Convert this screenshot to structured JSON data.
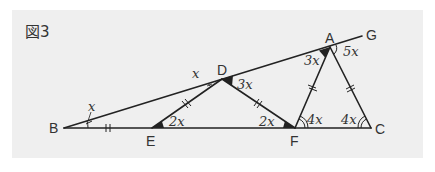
{
  "figure": {
    "label": "図3",
    "background_color": "#efefef",
    "line_color": "#222222"
  },
  "points": {
    "A": {
      "label": "A",
      "x": 330,
      "y": 47
    },
    "B": {
      "label": "B",
      "x": 64,
      "y": 128
    },
    "C": {
      "label": "C",
      "x": 371,
      "y": 128
    },
    "D": {
      "label": "D",
      "x": 222,
      "y": 79
    },
    "E": {
      "label": "E",
      "x": 152,
      "y": 128
    },
    "F": {
      "label": "F",
      "x": 295,
      "y": 128
    },
    "G": {
      "label": "G",
      "x": 362,
      "y": 36
    }
  },
  "angles": {
    "B": "x",
    "D_outer": "x",
    "D": "3x",
    "E": "2x",
    "F_left": "2x",
    "F_right": "4x",
    "C": "4x",
    "A_left": "3x",
    "A_right": "5x"
  },
  "segments": [
    {
      "from": "B",
      "to": "G"
    },
    {
      "from": "B",
      "to": "C"
    },
    {
      "from": "E",
      "to": "D"
    },
    {
      "from": "D",
      "to": "F"
    },
    {
      "from": "F",
      "to": "A"
    },
    {
      "from": "A",
      "to": "C"
    }
  ],
  "equal_marks": [
    "BE",
    "ED",
    "DF",
    "FA",
    "AC"
  ]
}
